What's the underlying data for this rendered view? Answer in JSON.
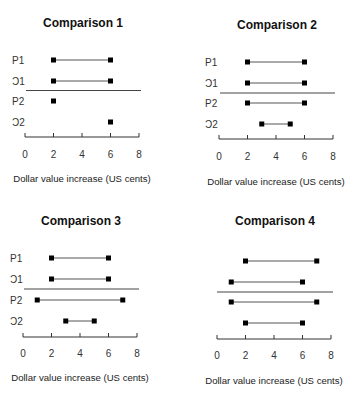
{
  "chart_data": [
    {
      "type": "dot-range",
      "title": "Comparison 1",
      "xlabel": "Dollar value increase (US cents)",
      "ylabel": "",
      "xlim": [
        0,
        8
      ],
      "xticks": [
        0,
        2,
        4,
        6,
        8
      ],
      "rows": [
        {
          "label": "P1",
          "values": [
            2,
            6
          ]
        },
        {
          "label": "Ɔ1",
          "values": [
            2,
            6
          ]
        },
        {
          "label": "P2",
          "values": [
            2
          ]
        },
        {
          "label": "Ɔ2",
          "values": [
            6
          ]
        }
      ],
      "separator_after_row": 2
    },
    {
      "type": "dot-range",
      "title": "Comparison 2",
      "xlabel": "Dollar value increase (US cents)",
      "ylabel": "",
      "xlim": [
        0,
        8
      ],
      "xticks": [
        0,
        2,
        4,
        6,
        8
      ],
      "rows": [
        {
          "label": "P1",
          "values": [
            2,
            6
          ]
        },
        {
          "label": "Ɔ1",
          "values": [
            2,
            6
          ]
        },
        {
          "label": "P2",
          "values": [
            2,
            6
          ]
        },
        {
          "label": "Ɔ2",
          "values": [
            3,
            5
          ]
        }
      ],
      "separator_after_row": 2
    },
    {
      "type": "dot-range",
      "title": "Comparison 3",
      "xlabel": "Dollar value increase (US cents)",
      "ylabel": "",
      "xlim": [
        0,
        8
      ],
      "xticks": [
        0,
        2,
        4,
        6,
        8
      ],
      "rows": [
        {
          "label": "P1",
          "values": [
            2,
            6
          ]
        },
        {
          "label": "Ɔ1",
          "values": [
            2,
            6
          ]
        },
        {
          "label": "P2",
          "values": [
            1,
            7
          ]
        },
        {
          "label": "Ɔ2",
          "values": [
            3,
            5
          ]
        }
      ],
      "separator_after_row": 2
    },
    {
      "type": "dot-range",
      "title": "Comparison 4",
      "xlabel": "Dollar value increase (US cents)",
      "ylabel": "",
      "xlim": [
        0,
        8
      ],
      "xticks": [
        0,
        2,
        4,
        6,
        8
      ],
      "rows": [
        {
          "label": "",
          "values": [
            2,
            7
          ]
        },
        {
          "label": "",
          "values": [
            1,
            6
          ]
        },
        {
          "label": "",
          "values": [
            1,
            7
          ]
        },
        {
          "label": "",
          "values": [
            2,
            6
          ]
        }
      ],
      "separator_after_row": 2
    }
  ],
  "layout": {
    "panels": [
      {
        "x0": 25,
        "x8": 139,
        "axis_y": 137,
        "rows_y": [
          60,
          81,
          101,
          122
        ],
        "sep_y": 90.5,
        "sep_x": [
          26,
          141
        ],
        "label_x": 12,
        "title_x": 83,
        "title_y": 27,
        "tick_y": 158,
        "xlabel_x": 82,
        "xlabel_y": 182
      },
      {
        "x0": 219,
        "x8": 333,
        "axis_y": 139,
        "rows_y": [
          62,
          83,
          103,
          124
        ],
        "sep_y": 93,
        "sep_x": [
          220,
          335
        ],
        "label_x": 205,
        "title_x": 277,
        "title_y": 29,
        "tick_y": 160,
        "xlabel_x": 276,
        "xlabel_y": 185
      },
      {
        "x0": 23,
        "x8": 137,
        "axis_y": 337,
        "rows_y": [
          258,
          279,
          300,
          321
        ],
        "sep_y": 289,
        "sep_x": [
          24,
          139
        ],
        "label_x": 10,
        "title_x": 81,
        "title_y": 225,
        "tick_y": 357,
        "xlabel_x": 80,
        "xlabel_y": 381
      },
      {
        "x0": 217,
        "x8": 331,
        "axis_y": 339,
        "rows_y": [
          261,
          282,
          302,
          323
        ],
        "sep_y": 292,
        "sep_x": [
          217,
          333
        ],
        "label_x": 204,
        "title_x": 275,
        "title_y": 225,
        "tick_y": 359,
        "xlabel_x": 274,
        "xlabel_y": 384
      }
    ]
  }
}
